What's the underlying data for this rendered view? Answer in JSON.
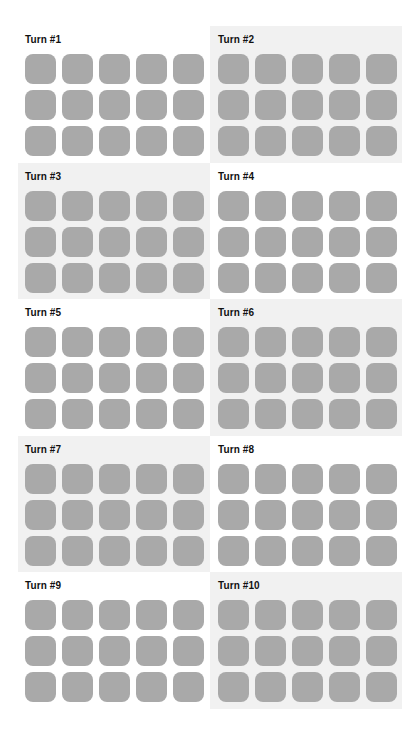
{
  "panels": [
    {
      "label": "Turn #1",
      "shaded": false,
      "rows": 3,
      "cols": 5
    },
    {
      "label": "Turn #2",
      "shaded": true,
      "rows": 3,
      "cols": 5
    },
    {
      "label": "Turn #3",
      "shaded": true,
      "rows": 3,
      "cols": 5
    },
    {
      "label": "Turn #4",
      "shaded": false,
      "rows": 3,
      "cols": 5
    },
    {
      "label": "Turn #5",
      "shaded": false,
      "rows": 3,
      "cols": 5
    },
    {
      "label": "Turn #6",
      "shaded": true,
      "rows": 3,
      "cols": 5
    },
    {
      "label": "Turn #7",
      "shaded": true,
      "rows": 3,
      "cols": 5
    },
    {
      "label": "Turn #8",
      "shaded": false,
      "rows": 3,
      "cols": 5
    },
    {
      "label": "Turn #9",
      "shaded": false,
      "rows": 3,
      "cols": 5
    },
    {
      "label": "Turn #10",
      "shaded": true,
      "rows": 3,
      "cols": 5
    }
  ],
  "colors": {
    "tile": "#a9a9a9",
    "panel_shaded": "#f1f1f1",
    "panel_plain": "#ffffff",
    "label": "#111111"
  }
}
